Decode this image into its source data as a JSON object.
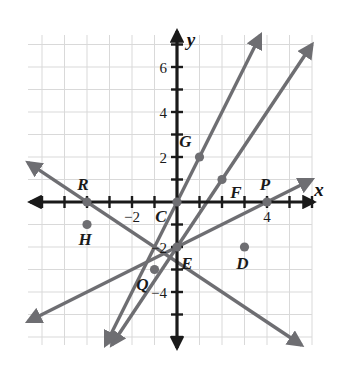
{
  "figure": {
    "kind": "coordinate-plane",
    "background_color": "#ffffff",
    "grid_color": "#d9d9d9",
    "axis_color": "#1a1a1a",
    "line_color": "#6e6e72",
    "point_color": "#6e6e72",
    "label_color": "#1a1a1a"
  },
  "axes": {
    "x_axis_label": "x",
    "y_axis_label": "y",
    "x_tick_labels": [
      {
        "text": "−2",
        "value": -2
      },
      {
        "text": "4",
        "value": 4
      }
    ],
    "y_tick_labels": [
      {
        "text": "6",
        "value": 6
      },
      {
        "text": "4",
        "value": 4
      },
      {
        "text": "2",
        "value": 2
      },
      {
        "text": "−2",
        "value": -2
      },
      {
        "text": "−4",
        "value": -4
      }
    ],
    "x_range": [
      -6,
      6
    ],
    "y_range": [
      -6,
      8
    ],
    "grid": true,
    "unit_px": 22.5,
    "origin_px": {
      "x": 177,
      "y": 202
    }
  },
  "chart_data": {
    "type": "scatter",
    "title": "",
    "xlabel": "x",
    "ylabel": "y",
    "xlim": [
      -6,
      6
    ],
    "ylim": [
      -6,
      8
    ],
    "grid": true,
    "points": [
      {
        "label": "R",
        "x": -4,
        "y": 0,
        "label_dx": -4,
        "label_dy": -12
      },
      {
        "label": "H",
        "x": -4,
        "y": -1,
        "label_dx": -2,
        "label_dy": 20
      },
      {
        "label": "C",
        "x": 0,
        "y": 0,
        "label_dx": -16,
        "label_dy": 20
      },
      {
        "label": "G",
        "x": 1,
        "y": 2,
        "label_dx": -14,
        "label_dy": -10
      },
      {
        "label": "F",
        "x": 2,
        "y": 1,
        "label_dx": 14,
        "label_dy": 18
      },
      {
        "label": "P",
        "x": 4,
        "y": 0,
        "label_dx": -2,
        "label_dy": -12
      },
      {
        "label": "E",
        "x": 0,
        "y": -2,
        "label_dx": 10,
        "label_dy": 22
      },
      {
        "label": "D",
        "x": 3,
        "y": -2,
        "label_dx": -2,
        "label_dy": 22
      },
      {
        "label": "Q",
        "x": -1,
        "y": -3,
        "label_dx": -12,
        "label_dy": 20
      }
    ],
    "lines": [
      {
        "name": "line-QEF-steep-positive",
        "through": [
          [
            -1,
            -3
          ],
          [
            0,
            -2
          ],
          [
            2,
            1
          ]
        ],
        "slope": 1.5,
        "intercept": -2
      },
      {
        "name": "line-CG-positive",
        "through": [
          [
            0,
            0
          ],
          [
            1,
            2
          ]
        ],
        "slope": 2,
        "intercept": 0
      },
      {
        "name": "line-RD-negative",
        "through": [
          [
            -4,
            0
          ],
          [
            3,
            -2
          ]
        ],
        "slope": -0.6667,
        "intercept": -2.6667
      },
      {
        "name": "line-HP-shallow-positive",
        "through": [
          [
            -4,
            -1
          ],
          [
            4,
            0
          ]
        ],
        "slope": 0.5,
        "intercept": -2
      }
    ]
  }
}
